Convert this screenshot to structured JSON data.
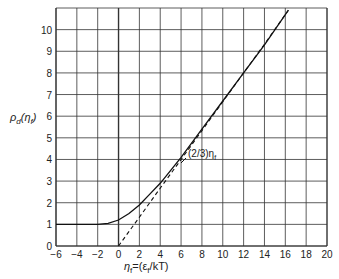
{
  "chart_data": {
    "type": "line",
    "title": "",
    "xlabel": "η_f = (ε_f / kT)",
    "ylabel": "ρ_d(η_f)",
    "xlim": [
      -6,
      20
    ],
    "ylim": [
      0,
      11
    ],
    "x_ticks": [
      -6,
      -4,
      -2,
      0,
      2,
      4,
      6,
      8,
      10,
      12,
      14,
      16,
      18,
      20
    ],
    "y_ticks": [
      0,
      1,
      2,
      3,
      4,
      5,
      6,
      7,
      8,
      9,
      10
    ],
    "grid": true,
    "series": [
      {
        "name": "ρ_d(η_f)",
        "style": "solid",
        "x": [
          -6,
          -4,
          -2,
          -1,
          0,
          1,
          2,
          3,
          4,
          5,
          6,
          8,
          10,
          12,
          14,
          16.3
        ],
        "y": [
          1,
          1,
          1,
          1.05,
          1.2,
          1.5,
          1.9,
          2.4,
          2.9,
          3.5,
          4.1,
          5.4,
          6.7,
          8.0,
          9.3,
          10.9
        ]
      },
      {
        "name": "(2/3)η_f",
        "style": "dashed",
        "x": [
          0,
          2,
          4,
          6,
          8,
          10,
          12,
          14,
          16.3
        ],
        "y": [
          0,
          1.33,
          2.67,
          4.0,
          5.33,
          6.67,
          8.0,
          9.33,
          10.9
        ]
      }
    ],
    "annotations": [
      {
        "text": "(2/3)η_f",
        "x": 6.3,
        "y": 4.0
      }
    ]
  },
  "labels": {
    "ylabel_main": "ρ",
    "ylabel_sub": "d",
    "ylabel_arg": "(η",
    "ylabel_argsub": "f",
    "ylabel_close": ")",
    "xlabel_main": "η",
    "xlabel_sub": "f",
    "xlabel_rest": "=(ε",
    "xlabel_sub2": "f",
    "xlabel_tail": "/kT)",
    "annot": "(2/3)η",
    "annot_sub": "f"
  }
}
